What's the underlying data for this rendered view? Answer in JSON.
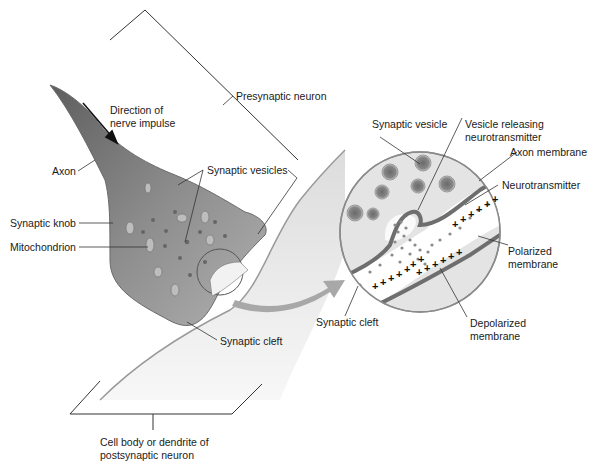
{
  "diagram": {
    "labels": {
      "direction_line1": "Direction of",
      "direction_line2": "nerve impulse",
      "presynaptic_neuron": "Presynaptic neuron",
      "axon": "Axon",
      "synaptic_vesicles": "Synaptic vesicles",
      "synaptic_knob": "Synaptic knob",
      "mitochondrion": "Mitochondrion",
      "synaptic_cleft": "Synaptic cleft",
      "postsynaptic_line1": "Cell body or dendrite of",
      "postsynaptic_line2": "postsynaptic neuron",
      "inset_synaptic_vesicle": "Synaptic vesicle",
      "inset_vesicle_releasing_line1": "Vesicle releasing",
      "inset_vesicle_releasing_line2": "neurotransmitter",
      "inset_axon_membrane": "Axon membrane",
      "inset_neurotransmitter": "Neurotransmitter",
      "inset_polarized_line1": "Polarized",
      "inset_polarized_line2": "membrane",
      "inset_depolarized_line1": "Depolarized",
      "inset_depolarized_line2": "membrane",
      "inset_synaptic_cleft": "Synaptic cleft"
    },
    "symbols": {
      "charge_plus": "+"
    },
    "colors": {
      "neuron_gray": "#8a8a8a",
      "neuron_light": "#d6d6d6",
      "membrane_dark": "#6e6e6e",
      "line": "#2a2a2a",
      "arrow_gray": "#9a9a9a"
    }
  }
}
